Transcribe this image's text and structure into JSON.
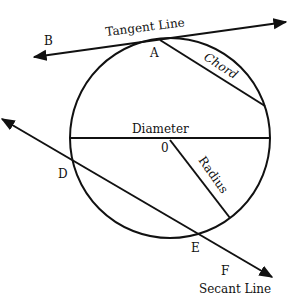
{
  "diagram": {
    "labels": {
      "tangent_line": "Tangent Line",
      "chord": "Chord",
      "diameter": "Diameter",
      "radius": "Radius",
      "secant_line": "Secant Line",
      "center": "0",
      "point_a": "A",
      "point_b": "B",
      "point_d": "D",
      "point_e": "E",
      "point_f": "F"
    },
    "colors": {
      "stroke": "#111111",
      "background": "#ffffff"
    }
  }
}
